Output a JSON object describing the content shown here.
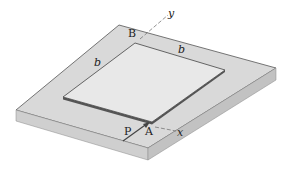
{
  "diagram": {
    "type": "isometric mechanics figure",
    "labels": {
      "B": "B",
      "A": "A",
      "P": "P",
      "b_top": "b",
      "b_left": "b",
      "x_axis": "x",
      "y_axis": "y"
    },
    "colors": {
      "slab_top": "#d9d9d9",
      "slab_front": "#c4c4c4",
      "slab_side": "#b5b5b5",
      "plate": "#e8e8e8",
      "edge": "#555555",
      "axis": "#777777",
      "force": "#444444"
    }
  }
}
